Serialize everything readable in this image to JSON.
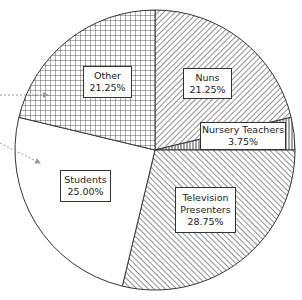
{
  "chart_data": {
    "type": "pie",
    "title": "",
    "start_angle": "12 o'clock",
    "direction": "clockwise",
    "legend": "none (labels inside slices)",
    "categories": [
      "Nuns",
      "Nursery Teachers",
      "Television Presenters",
      "Students",
      "Other"
    ],
    "values": [
      21.25,
      3.75,
      28.75,
      25.0,
      21.25
    ],
    "slices": [
      {
        "label": "Nuns",
        "value": 21.25,
        "display": "21.25%",
        "pattern": "diagonal-hatch-back"
      },
      {
        "label": "Nursery Teachers",
        "value": 3.75,
        "display": "3.75%",
        "pattern": "vertical-lines"
      },
      {
        "label": "Television Presenters",
        "value": 28.75,
        "display": "28.75%",
        "pattern": "diagonal-hatch-forward"
      },
      {
        "label": "Students",
        "value": 25.0,
        "display": "25.00%",
        "pattern": "none"
      },
      {
        "label": "Other",
        "value": 21.25,
        "display": "21.25%",
        "pattern": "crosshatch-grid"
      }
    ],
    "annotations": [
      "dotted arrow pointing into Other slice",
      "dotted arrow pointing into Students slice"
    ]
  },
  "labels": {
    "nuns": {
      "name": "Nuns",
      "pct": "21.25%"
    },
    "nursery": {
      "name": "Nursery Teachers",
      "pct": "3.75%"
    },
    "tv": {
      "name1": "Television",
      "name2": "Presenters",
      "pct": "28.75%"
    },
    "students": {
      "name": "Students",
      "pct": "25.00%"
    },
    "other": {
      "name": "Other",
      "pct": "21.25%"
    }
  },
  "colors": {
    "stroke": "#333333",
    "hatch": "#333333",
    "background": "#ffffff",
    "arrow": "#999999"
  }
}
